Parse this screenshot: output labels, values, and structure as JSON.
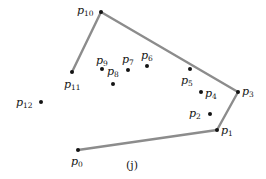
{
  "figure": {
    "caption": "(j)",
    "width": 266,
    "height": 179,
    "background": "#ffffff",
    "edge_color": "#8c8c8c",
    "point_color": "#141414",
    "label_color": "#141414",
    "edge_width": 2.4,
    "point_radius": 2.0
  },
  "chart_data": {
    "type": "scatter",
    "title": "(j)",
    "xlabel": "",
    "ylabel": "",
    "xlim": [
      0,
      266
    ],
    "ylim": [
      179,
      0
    ],
    "grid": false,
    "legend": false,
    "point_names": [
      "p0",
      "p1",
      "p2",
      "p3",
      "p4",
      "p5",
      "p6",
      "p7",
      "p8",
      "p9",
      "p10",
      "p11",
      "p12"
    ],
    "points": [
      {
        "name": "p0",
        "x": 78,
        "y": 150,
        "on_hull": true,
        "label_dx": -7,
        "label_dy": 6
      },
      {
        "name": "p1",
        "x": 217,
        "y": 130,
        "on_hull": true,
        "label_dx": 4,
        "label_dy": -5
      },
      {
        "name": "p2",
        "x": 210,
        "y": 114,
        "on_hull": false,
        "label_dx": -21,
        "label_dy": -6
      },
      {
        "name": "p3",
        "x": 238,
        "y": 92,
        "on_hull": true,
        "label_dx": 4,
        "label_dy": -6
      },
      {
        "name": "p4",
        "x": 201,
        "y": 92,
        "on_hull": false,
        "label_dx": 4,
        "label_dy": -4
      },
      {
        "name": "p5",
        "x": 190,
        "y": 69,
        "on_hull": false,
        "label_dx": -9,
        "label_dy": 6
      },
      {
        "name": "p6",
        "x": 147,
        "y": 66,
        "on_hull": false,
        "label_dx": -6,
        "label_dy": -16
      },
      {
        "name": "p7",
        "x": 128,
        "y": 70,
        "on_hull": false,
        "label_dx": -6,
        "label_dy": -16
      },
      {
        "name": "p8",
        "x": 113,
        "y": 84,
        "on_hull": false,
        "label_dx": -6,
        "label_dy": -18
      },
      {
        "name": "p9",
        "x": 102,
        "y": 69,
        "on_hull": false,
        "label_dx": -6,
        "label_dy": -14
      },
      {
        "name": "p10",
        "x": 101,
        "y": 12,
        "on_hull": true,
        "label_dx": -24,
        "label_dy": -7
      },
      {
        "name": "p11",
        "x": 72,
        "y": 72,
        "on_hull": true,
        "label_dx": -8,
        "label_dy": 7
      },
      {
        "name": "p12",
        "x": 41,
        "y": 102,
        "on_hull": false,
        "label_dx": -25,
        "label_dy": -5
      }
    ],
    "edges": [
      {
        "from": "p0",
        "to": "p1"
      },
      {
        "from": "p1",
        "to": "p3"
      },
      {
        "from": "p3",
        "to": "p10"
      },
      {
        "from": "p10",
        "to": "p11"
      }
    ],
    "labels": [
      {
        "name": "p0",
        "base": "p",
        "sub": "0"
      },
      {
        "name": "p1",
        "base": "p",
        "sub": "1"
      },
      {
        "name": "p2",
        "base": "p",
        "sub": "2"
      },
      {
        "name": "p3",
        "base": "p",
        "sub": "3"
      },
      {
        "name": "p4",
        "base": "p",
        "sub": "4"
      },
      {
        "name": "p5",
        "base": "p",
        "sub": "5"
      },
      {
        "name": "p6",
        "base": "p",
        "sub": "6"
      },
      {
        "name": "p7",
        "base": "p",
        "sub": "7"
      },
      {
        "name": "p8",
        "base": "p",
        "sub": "8"
      },
      {
        "name": "p9",
        "base": "p",
        "sub": "9"
      },
      {
        "name": "p10",
        "base": "p",
        "sub": "10"
      },
      {
        "name": "p11",
        "base": "p",
        "sub": "11"
      },
      {
        "name": "p12",
        "base": "p",
        "sub": "12"
      }
    ]
  }
}
